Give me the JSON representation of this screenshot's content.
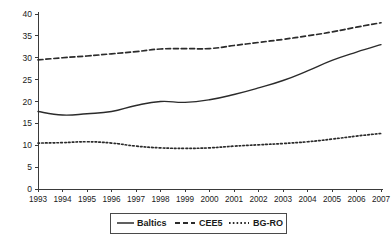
{
  "chart_data": {
    "type": "line",
    "title": "",
    "subtitle": "",
    "xlabel": "",
    "ylabel": "",
    "xlim": [
      1993,
      2007
    ],
    "ylim": [
      0,
      40
    ],
    "yticks": [
      0,
      5,
      10,
      15,
      20,
      25,
      30,
      35,
      40
    ],
    "grid": false,
    "legend_position": "bottom",
    "categories": [
      "1993",
      "1994",
      "1995",
      "1996",
      "1997",
      "1998",
      "1999",
      "2000",
      "2001",
      "2002",
      "2003",
      "2004",
      "2005",
      "2006",
      "2007"
    ],
    "x": [
      1993,
      1994,
      1995,
      1996,
      1997,
      1998,
      1999,
      2000,
      2001,
      2002,
      2003,
      2004,
      2005,
      2006,
      2007
    ],
    "series": [
      {
        "name": "Baltics",
        "style": "solid",
        "color": "#2b2b2b",
        "values": [
          17.7,
          16.9,
          17.2,
          17.7,
          19.1,
          20.0,
          19.8,
          20.4,
          21.6,
          23.1,
          24.8,
          27.0,
          29.4,
          31.3,
          33.0
        ]
      },
      {
        "name": "CEE5",
        "style": "dashed",
        "color": "#2b2b2b",
        "values": [
          29.5,
          30.0,
          30.4,
          30.9,
          31.4,
          32.0,
          32.1,
          32.1,
          32.8,
          33.5,
          34.2,
          35.0,
          35.9,
          37.0,
          38.0
        ]
      },
      {
        "name": "BG-RO",
        "style": "dotted",
        "color": "#2b2b2b",
        "values": [
          10.5,
          10.6,
          10.8,
          10.5,
          9.8,
          9.4,
          9.3,
          9.4,
          9.8,
          10.1,
          10.4,
          10.8,
          11.4,
          12.1,
          12.7
        ]
      }
    ]
  },
  "legend": {
    "items": [
      {
        "label": "Baltics",
        "style": "solid"
      },
      {
        "label": "CEE5",
        "style": "dashed"
      },
      {
        "label": "BG-RO",
        "style": "dotted"
      }
    ]
  },
  "axes": {
    "y_tick_labels": [
      "0",
      "5",
      "10",
      "15",
      "20",
      "25",
      "30",
      "35",
      "40"
    ],
    "x_tick_labels": [
      "1993",
      "1994",
      "1995",
      "1996",
      "1997",
      "1998",
      "1999",
      "2000",
      "2001",
      "2002",
      "2003",
      "2004",
      "2005",
      "2006",
      "2007"
    ]
  }
}
